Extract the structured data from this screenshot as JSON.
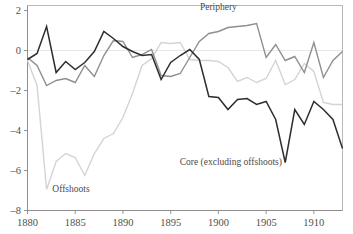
{
  "chart_data": {
    "type": "line",
    "title": "",
    "xlabel": "",
    "ylabel": "",
    "xlim": [
      1880,
      1913
    ],
    "ylim": [
      -8,
      2.6
    ],
    "xticks": [
      1880,
      1885,
      1890,
      1895,
      1900,
      1905,
      1910
    ],
    "xtick_labels": [
      "1880",
      "1885",
      "1890",
      "1895",
      "1900",
      "1905",
      "1910"
    ],
    "yticks": [
      2,
      0,
      -2,
      -4,
      -6,
      -8
    ],
    "ytick_labels": [
      "2",
      "0",
      "–2",
      "–4",
      "–6",
      "–8"
    ],
    "grid": false,
    "zero_reference_line": true,
    "legend_position": "inline-annotations",
    "annotations": [
      {
        "name": "periphery",
        "text": "Periphery",
        "x": 1900.0,
        "y": 2.05
      },
      {
        "name": "offshoots",
        "text": "Offshoots",
        "x": 1882.6,
        "y": -7.05
      },
      {
        "name": "core",
        "text": "Core (excluding offshoots)",
        "x": 1901.3,
        "y": -5.7
      }
    ],
    "series": [
      {
        "name": "Core (excluding offshoots)",
        "color": "#2e2e2e",
        "width": 1.5,
        "x": [
          1880,
          1881,
          1882,
          1883,
          1884,
          1885,
          1886,
          1887,
          1888,
          1889,
          1890,
          1891,
          1892,
          1893,
          1894,
          1895,
          1896,
          1897,
          1898,
          1899,
          1900,
          1901,
          1902,
          1903,
          1904,
          1905,
          1906,
          1907,
          1908,
          1909,
          1910,
          1911,
          1912,
          1913
        ],
        "values": [
          -0.45,
          -0.15,
          1.2,
          -1.1,
          -0.55,
          -0.95,
          -0.6,
          -0.05,
          0.95,
          0.6,
          0.2,
          -0.05,
          -0.25,
          -0.2,
          -1.45,
          -0.6,
          -0.25,
          0.05,
          -0.45,
          -2.3,
          -2.35,
          -2.95,
          -2.45,
          -2.4,
          -2.7,
          -2.55,
          -3.45,
          -5.6,
          -2.95,
          -3.7,
          -2.55,
          -2.95,
          -3.45,
          -4.9
        ]
      },
      {
        "name": "Periphery",
        "color": "#8f8f8f",
        "width": 1.4,
        "x": [
          1880,
          1881,
          1882,
          1883,
          1884,
          1885,
          1886,
          1887,
          1888,
          1889,
          1890,
          1891,
          1892,
          1893,
          1894,
          1895,
          1896,
          1897,
          1898,
          1899,
          1900,
          1901,
          1902,
          1903,
          1904,
          1905,
          1906,
          1907,
          1908,
          1909,
          1910,
          1911,
          1912,
          1913
        ],
        "values": [
          -0.35,
          -0.75,
          -1.75,
          -1.5,
          -1.4,
          -1.6,
          -0.75,
          -1.3,
          -0.25,
          0.5,
          0.45,
          -0.35,
          -0.2,
          0.05,
          -1.25,
          -1.3,
          -1.15,
          -0.35,
          0.45,
          0.85,
          0.95,
          1.15,
          1.2,
          1.25,
          1.35,
          -0.35,
          0.3,
          -0.5,
          -0.3,
          -1.1,
          0.4,
          -1.35,
          -0.5,
          -0.05
        ]
      },
      {
        "name": "Offshoots",
        "color": "#d4d4d4",
        "width": 1.4,
        "x": [
          1880,
          1881,
          1882,
          1883,
          1884,
          1885,
          1886,
          1887,
          1888,
          1889,
          1890,
          1891,
          1892,
          1893,
          1894,
          1895,
          1896,
          1897,
          1898,
          1899,
          1900,
          1901,
          1902,
          1903,
          1904,
          1905,
          1906,
          1907,
          1908,
          1909,
          1910,
          1911,
          1912,
          1913
        ],
        "values": [
          -0.5,
          -1.75,
          -6.95,
          -5.55,
          -5.15,
          -5.35,
          -6.25,
          -5.15,
          -4.4,
          -4.15,
          -3.35,
          -2.15,
          -0.75,
          -0.4,
          0.4,
          0.35,
          0.4,
          -0.45,
          -0.5,
          -0.5,
          -0.55,
          -0.85,
          -1.55,
          -1.35,
          -1.6,
          -1.4,
          -0.5,
          -1.7,
          -1.45,
          -0.65,
          -1.05,
          -2.6,
          -2.7,
          -2.7
        ]
      }
    ]
  }
}
